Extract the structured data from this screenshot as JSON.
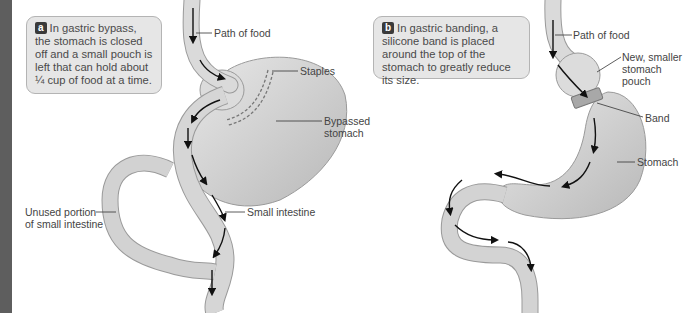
{
  "panel_a": {
    "badge": "a",
    "caption": "In gastric bypass, the stomach is closed off and a small pouch is left that can hold about ¼ cup of food at a time.",
    "labels": {
      "path_of_food": "Path of food",
      "staples": "Staples",
      "bypassed_stomach_1": "Bypassed",
      "bypassed_stomach_2": "stomach",
      "unused_portion_1": "Unused portion",
      "unused_portion_2": "of small intestine",
      "small_intestine": "Small intestine"
    }
  },
  "panel_b": {
    "badge": "b",
    "caption": "In gastric banding, a silicone band is placed around the top of the stomach to greatly reduce its size.",
    "labels": {
      "path_of_food": "Path of food",
      "new_pouch_1": "New, smaller",
      "new_pouch_2": "stomach",
      "new_pouch_3": "pouch",
      "band": "Band",
      "stomach": "Stomach"
    }
  },
  "colors": {
    "organ_fill": "#d8d8d8",
    "organ_shade": "#bdbdbd",
    "callout_bg": "#e6e6e6",
    "sidebar": "#5e5e5e"
  }
}
